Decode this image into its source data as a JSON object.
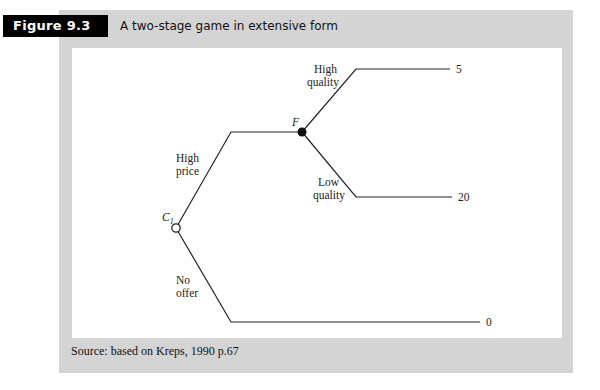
{
  "figure": {
    "label": "Figure 9.3",
    "title": "A two-stage game in extensive form",
    "source": "Source: based on Kreps, 1990 p.67"
  },
  "tree": {
    "nodes": {
      "c1": {
        "label": "C",
        "subscript": "1",
        "style": "hollow"
      },
      "f": {
        "label": "F",
        "style": "filled"
      }
    },
    "branches": {
      "high_price": {
        "line1": "High",
        "line2": "price"
      },
      "no_offer": {
        "line1": "No",
        "line2": "offer"
      },
      "high_quality": {
        "line1": "High",
        "line2": "quality"
      },
      "low_quality": {
        "line1": "Low",
        "line2": "quality"
      }
    },
    "payoffs": {
      "high_quality": "5",
      "low_quality": "20",
      "no_offer": "0"
    }
  },
  "colors": {
    "frame": "#d4d4d4",
    "label_bg": "#000000",
    "line": "#222222"
  }
}
